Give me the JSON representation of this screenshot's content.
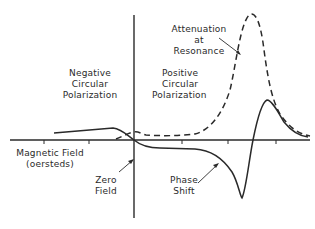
{
  "labels": {
    "negative_polarization": [
      "Negative",
      "Circular",
      "Polarization"
    ],
    "positive_polarization": [
      "Positive",
      "Circular",
      "Polarization"
    ],
    "attenuation": [
      "Attenuation",
      "at",
      "Resonance"
    ],
    "x_axis": [
      "Magnetic Field",
      "(oersteds)"
    ],
    "zero_field": [
      "Zero",
      "Field"
    ],
    "phase_shift": [
      "Phase",
      "Shift"
    ]
  },
  "colors": {
    "ink": "#2a2a2a",
    "background": "#ffffff"
  },
  "curves": {
    "attenuation": {
      "style": "dashed",
      "description": "Attenuation curve with sharp resonance peak in positive field region"
    },
    "phase_shift": {
      "style": "solid",
      "description": "Phase shift curve, dispersive shape with minimum before resonance and maximum after"
    }
  }
}
